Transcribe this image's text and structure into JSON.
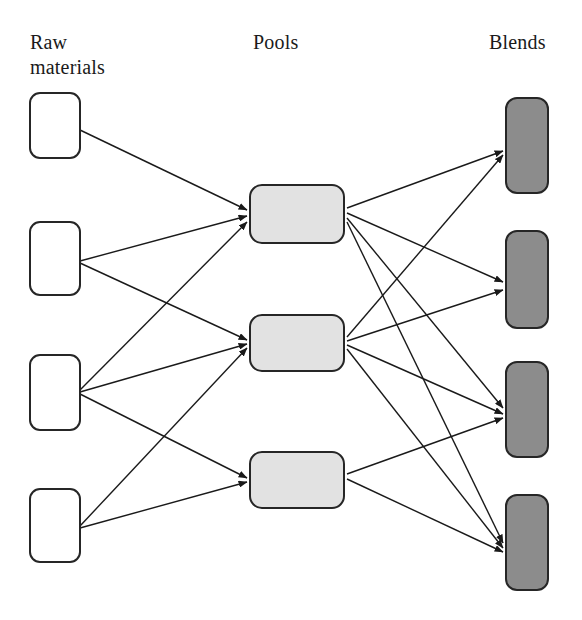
{
  "diagram": {
    "type": "pooling-network",
    "title": "",
    "columns": [
      {
        "id": "raw",
        "label": "Raw\nmaterials"
      },
      {
        "id": "pools",
        "label": "Pools"
      },
      {
        "id": "blends",
        "label": "Blends"
      }
    ],
    "colors": {
      "raw_fill": "#ffffff",
      "raw_stroke": "#262626",
      "pool_fill": "#e2e2e2",
      "pool_stroke": "#262626",
      "blend_fill": "#8c8c8c",
      "blend_stroke": "#262626",
      "edge": "#1a1a1a",
      "background": "#ffffff",
      "text": "#1a1a1a"
    },
    "nodes": {
      "raw": [
        {
          "id": "r1",
          "label": "",
          "x": 30,
          "y": 93,
          "w": 50,
          "h": 65,
          "rx": 10
        },
        {
          "id": "r2",
          "label": "",
          "x": 30,
          "y": 222,
          "w": 50,
          "h": 73,
          "rx": 10
        },
        {
          "id": "r3",
          "label": "",
          "x": 30,
          "y": 355,
          "w": 50,
          "h": 75,
          "rx": 10
        },
        {
          "id": "r4",
          "label": "",
          "x": 30,
          "y": 489,
          "w": 50,
          "h": 73,
          "rx": 10
        }
      ],
      "pools": [
        {
          "id": "p1",
          "label": "",
          "x": 250,
          "y": 185,
          "w": 94,
          "h": 58,
          "rx": 12
        },
        {
          "id": "p2",
          "label": "",
          "x": 250,
          "y": 315,
          "w": 94,
          "h": 56,
          "rx": 12
        },
        {
          "id": "p3",
          "label": "",
          "x": 250,
          "y": 452,
          "w": 94,
          "h": 56,
          "rx": 12
        }
      ],
      "blends": [
        {
          "id": "b1",
          "label": "",
          "x": 506,
          "y": 98,
          "w": 42,
          "h": 95,
          "rx": 11
        },
        {
          "id": "b2",
          "label": "",
          "x": 506,
          "y": 231,
          "w": 42,
          "h": 97,
          "rx": 11
        },
        {
          "id": "b3",
          "label": "",
          "x": 506,
          "y": 362,
          "w": 42,
          "h": 95,
          "rx": 11
        },
        {
          "id": "b4",
          "label": "",
          "x": 506,
          "y": 495,
          "w": 42,
          "h": 95,
          "rx": 11
        }
      ]
    },
    "edges": [
      {
        "from": "r1",
        "to": "p1",
        "x1": 80,
        "y1": 130,
        "x2": 247,
        "y2": 210
      },
      {
        "from": "r2",
        "to": "p1",
        "x1": 80,
        "y1": 261,
        "x2": 247,
        "y2": 216
      },
      {
        "from": "r2",
        "to": "p2",
        "x1": 80,
        "y1": 263,
        "x2": 247,
        "y2": 340
      },
      {
        "from": "r3",
        "to": "p1",
        "x1": 80,
        "y1": 390,
        "x2": 247,
        "y2": 222
      },
      {
        "from": "r3",
        "to": "p2",
        "x1": 80,
        "y1": 392,
        "x2": 247,
        "y2": 344
      },
      {
        "from": "r3",
        "to": "p3",
        "x1": 80,
        "y1": 394,
        "x2": 247,
        "y2": 478
      },
      {
        "from": "r4",
        "to": "p2",
        "x1": 80,
        "y1": 526,
        "x2": 247,
        "y2": 348
      },
      {
        "from": "r4",
        "to": "p3",
        "x1": 80,
        "y1": 528,
        "x2": 247,
        "y2": 482
      },
      {
        "from": "p1",
        "to": "b1",
        "x1": 347,
        "y1": 208,
        "x2": 503,
        "y2": 151
      },
      {
        "from": "p1",
        "to": "b2",
        "x1": 347,
        "y1": 213,
        "x2": 503,
        "y2": 282
      },
      {
        "from": "p1",
        "to": "b3",
        "x1": 347,
        "y1": 218,
        "x2": 503,
        "y2": 408
      },
      {
        "from": "p1",
        "to": "b4",
        "x1": 347,
        "y1": 222,
        "x2": 503,
        "y2": 543
      },
      {
        "from": "p2",
        "to": "b1",
        "x1": 347,
        "y1": 337,
        "x2": 503,
        "y2": 155
      },
      {
        "from": "p2",
        "to": "b2",
        "x1": 347,
        "y1": 341,
        "x2": 503,
        "y2": 290
      },
      {
        "from": "p2",
        "to": "b3",
        "x1": 347,
        "y1": 345,
        "x2": 503,
        "y2": 414
      },
      {
        "from": "p2",
        "to": "b4",
        "x1": 347,
        "y1": 349,
        "x2": 503,
        "y2": 548
      },
      {
        "from": "p3",
        "to": "b3",
        "x1": 347,
        "y1": 474,
        "x2": 503,
        "y2": 418
      },
      {
        "from": "p3",
        "to": "b4",
        "x1": 347,
        "y1": 479,
        "x2": 503,
        "y2": 552
      }
    ]
  }
}
